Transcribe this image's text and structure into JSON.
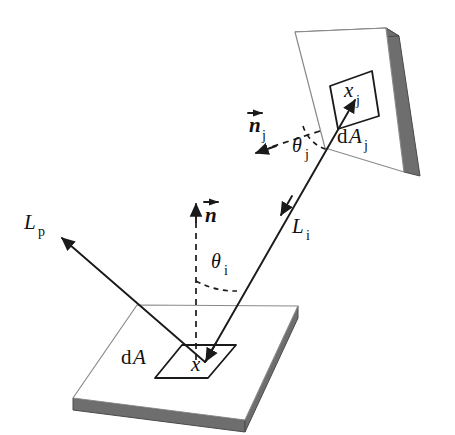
{
  "figure": {
    "type": "technical-line-diagram",
    "background_color": "#ffffff",
    "line_color": "#1a1a1a",
    "surface_top_color": "#ffffff",
    "surface_edge_color": "#8a8a8a",
    "surface_side_color": "#6e6e6e"
  },
  "labels": {
    "reflected_radiance": {
      "base": "L",
      "sub": "p"
    },
    "incident_radiance": {
      "base": "L",
      "sub": "i"
    },
    "normal_receiver": {
      "base": "n",
      "sub": ""
    },
    "normal_emitter": {
      "base": "n",
      "sub": "j"
    },
    "angle_incident": {
      "base": "θ",
      "sub": "i"
    },
    "angle_emitter": {
      "base": "θ",
      "sub": "j"
    },
    "point_receiver": {
      "base": "x",
      "sub": ""
    },
    "point_emitter": {
      "base": "x",
      "sub": "j"
    },
    "area_receiver_d": "d",
    "area_receiver_A": "A",
    "area_receiver_sub": "",
    "area_emitter_d": "d",
    "area_emitter_A": "A",
    "area_emitter_sub": "j"
  },
  "elements": {
    "lower_surface": "receiver-surface-slab",
    "upper_surface": "emitter-surface-slab",
    "lower_patch": "differential-area-dA",
    "upper_patch": "differential-area-dAj",
    "ray_incident": "incident-radiance-ray",
    "ray_reflected": "reflected-radiance-ray",
    "normal_line": "surface-normal-dashed-line",
    "normal_emitter_line": "emitter-normal-dashed-arrow",
    "arc_incident": "theta-i-angle-arc",
    "arc_emitter": "theta-j-angle-arc"
  }
}
